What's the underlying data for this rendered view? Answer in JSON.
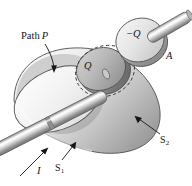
{
  "figure": {
    "background_color": "#ffffff",
    "ink_color": "#161616",
    "labels": {
      "path": {
        "text": "Path",
        "italic_part": "P",
        "full": "Path P"
      },
      "charge_inner": "Q",
      "charge_plate": "−Q",
      "plate_area": "A",
      "current": "I",
      "surface_cap": "S",
      "surface_cap_sub": "1",
      "surface_dome": "S",
      "surface_dome_sub": "2"
    },
    "icons": {
      "leader_path": "leader-line-arrow-icon",
      "leader_s1": "leader-line-arrow-icon",
      "leader_s2": "leader-line-arrow-icon",
      "current_arrow": "current-direction-arrow-icon",
      "dashed_loop": "dashed-circle-path-icon"
    },
    "shapes": {
      "dome_label": "gaussian-dome-surface",
      "cap_label": "flat-circular-cap",
      "rod_label": "current-carrying-rod",
      "inner_disc_label": "charged-disc-Q",
      "plate_label": "capacitor-plate-negative-Q",
      "plate_rod_label": "plate-rod-stub"
    },
    "palette": {
      "light": "#f2f2f2",
      "mid_light": "#dcdcdc",
      "mid": "#bdbdbd",
      "mid_dark": "#9e9e9e",
      "dark": "#7d7d7d",
      "darker": "#5e5e5e",
      "outline": "#4a4a4a"
    }
  }
}
